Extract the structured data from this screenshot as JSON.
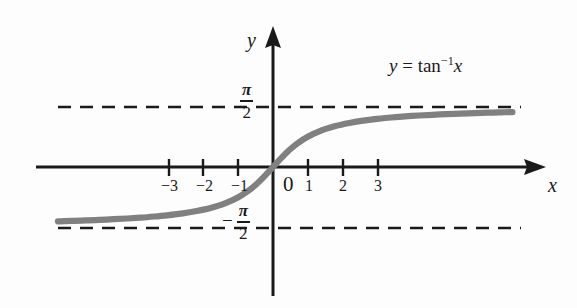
{
  "figure": {
    "equation": {
      "lhs": "y",
      "equals": "=",
      "function": "tan",
      "exponent": "−1",
      "argument": "x"
    },
    "axes": {
      "x_label": "x",
      "y_label": "y",
      "x_ticks": [
        "−3",
        "−2",
        "−1",
        "0",
        "1",
        "2",
        "3"
      ],
      "x_tick_values": [
        -3,
        -2,
        -1,
        0,
        1,
        2,
        3
      ]
    },
    "asymptotes": [
      {
        "name": "upper-asymptote",
        "label_numerator": "π",
        "label_denominator": "2",
        "sign": "",
        "value": 1.5707963
      },
      {
        "name": "lower-asymptote",
        "label_numerator": "π",
        "label_denominator": "2",
        "sign": "−",
        "value": -1.5707963
      }
    ],
    "colors": {
      "curve": "#808080",
      "axis": "#1a1a1a",
      "dash": "#1a1a1a",
      "background": "#fdfdfd",
      "text": "#1a1a1a"
    }
  },
  "chart_data": {
    "type": "line",
    "xlabel": "x",
    "ylabel": "y",
    "xlim": [
      -6.2,
      7.0
    ],
    "ylim": [
      -2.35,
      2.6
    ],
    "grid": false,
    "legend": null,
    "xticks": [
      -3,
      -2,
      -1,
      0,
      1,
      2,
      3
    ],
    "xticklabels": [
      "−3",
      "−2",
      "−1",
      "0",
      "1",
      "2",
      "3"
    ],
    "yticks": [
      -1.5707963,
      1.5707963
    ],
    "yticklabels": [
      "−π/2",
      "π/2"
    ],
    "annotations": [
      {
        "text": "y = tan⁻¹x",
        "x": 3.4,
        "y": 2.1
      }
    ],
    "asymptotes": [
      {
        "orientation": "horizontal",
        "y": 1.5707963,
        "style": "dashed",
        "label": "π/2"
      },
      {
        "orientation": "horizontal",
        "y": -1.5707963,
        "style": "dashed",
        "label": "−π/2"
      }
    ],
    "series": [
      {
        "name": "arctan(x)",
        "color": "#808080",
        "linewidth": 5,
        "x": [
          -6.2,
          -5.8,
          -5.4,
          -5.0,
          -4.6,
          -4.2,
          -3.8,
          -3.4,
          -3.0,
          -2.6,
          -2.2,
          -1.8,
          -1.4,
          -1.0,
          -0.7,
          -0.45,
          -0.25,
          -0.1,
          0,
          0.1,
          0.25,
          0.45,
          0.7,
          1.0,
          1.4,
          1.8,
          2.2,
          2.6,
          3.0,
          3.4,
          3.8,
          4.2,
          4.6,
          5.0,
          5.4,
          5.8,
          6.2,
          6.6,
          6.9
        ],
        "y": [
          -1.411,
          -1.4,
          -1.388,
          -1.373,
          -1.356,
          -1.337,
          -1.314,
          -1.286,
          -1.249,
          -1.204,
          -1.144,
          -1.064,
          -0.951,
          -0.785,
          -0.611,
          -0.423,
          -0.245,
          -0.1,
          0,
          0.1,
          0.245,
          0.423,
          0.611,
          0.785,
          0.951,
          1.064,
          1.144,
          1.204,
          1.249,
          1.286,
          1.314,
          1.337,
          1.356,
          1.373,
          1.388,
          1.4,
          1.411,
          1.42,
          1.426
        ]
      }
    ]
  }
}
